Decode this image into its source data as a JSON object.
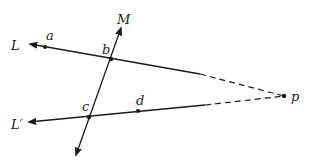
{
  "diagram": {
    "colors": {
      "stroke": "#1a1a1a",
      "background": "#ffffff"
    },
    "lines": {
      "L": {
        "label": "L"
      },
      "L_prime": {
        "label": "L′"
      },
      "M": {
        "label": "M"
      }
    },
    "points": {
      "a": {
        "label": "a"
      },
      "b": {
        "label": "b"
      },
      "c": {
        "label": "c"
      },
      "d": {
        "label": "d"
      },
      "p": {
        "label": "p"
      }
    }
  }
}
